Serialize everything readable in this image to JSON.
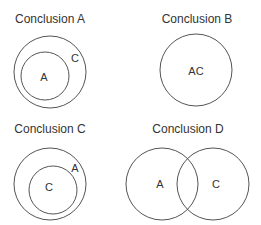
{
  "colors": {
    "stroke": "#555555",
    "text": "#333333",
    "background": "#ffffff"
  },
  "panels": [
    {
      "title": "Conclusion A",
      "description": "A is a subset of C",
      "circles": [
        {
          "label": "C",
          "cx": 50,
          "cy": 72,
          "r": 36,
          "label_x": 75,
          "label_y": 62
        },
        {
          "label": "A",
          "cx": 45,
          "cy": 76,
          "r": 24,
          "label_x": 44,
          "label_y": 81
        }
      ]
    },
    {
      "title": "Conclusion B",
      "description": "A and C are identical sets",
      "circles": [
        {
          "label": "AC",
          "cx": 196,
          "cy": 70,
          "r": 36,
          "label_x": 196,
          "label_y": 75
        }
      ]
    },
    {
      "title": "Conclusion C",
      "description": "C is a subset of A",
      "circles": [
        {
          "label": "A",
          "cx": 50,
          "cy": 184,
          "r": 36,
          "label_x": 75,
          "label_y": 172
        },
        {
          "label": "C",
          "cx": 53,
          "cy": 190,
          "r": 24,
          "label_x": 49,
          "label_y": 191
        }
      ]
    },
    {
      "title": "Conclusion D",
      "description": "A and C partially overlap",
      "circles": [
        {
          "label": "A",
          "cx": 162,
          "cy": 184,
          "r": 36,
          "label_x": 160,
          "label_y": 188
        },
        {
          "label": "C",
          "cx": 213,
          "cy": 184,
          "r": 36,
          "label_x": 216,
          "label_y": 188
        }
      ]
    }
  ],
  "title_positions": [
    {
      "x": 50,
      "y": 23
    },
    {
      "x": 197,
      "y": 23
    },
    {
      "x": 50,
      "y": 133
    },
    {
      "x": 188,
      "y": 133
    }
  ]
}
